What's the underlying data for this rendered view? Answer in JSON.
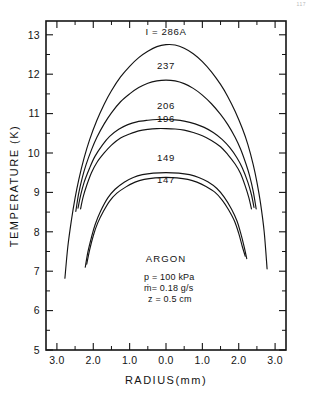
{
  "figure": {
    "corner_mark": "117"
  },
  "chart_data": {
    "type": "line",
    "title": "",
    "xlabel": "RADIUS(mm)",
    "ylabel": "TEMPERATURE (K)",
    "xlim": [
      -3.3,
      3.3
    ],
    "ylim": [
      5,
      13.35
    ],
    "grid": false,
    "legend_position": "inline-curve-labels",
    "x_tick_values": [
      -3.0,
      -2.0,
      -1.0,
      0.0,
      1.0,
      2.0,
      3.0
    ],
    "x_tick_labels": [
      "3.0",
      "2.0",
      "1.0",
      "0.0",
      "1.0",
      "2.0",
      "3.0"
    ],
    "x_minor_step": 0.5,
    "y_tick_values": [
      5,
      6,
      7,
      8,
      9,
      10,
      11,
      12,
      13
    ],
    "y_tick_labels": [
      "5",
      "6",
      "7",
      "8",
      "9",
      "10",
      "11",
      "12",
      "13"
    ],
    "y_minor_step": 0.5,
    "series": [
      {
        "name": "286",
        "label": "I = 286A",
        "current_amperes": 286,
        "peak_temperature_k": 12.75,
        "edge_radius_mm": 2.78,
        "edge_temperature_k": 6.82,
        "label_x_mm": 0.0,
        "label_y_k": 13.0,
        "points": [
          [
            -2.78,
            6.82
          ],
          [
            -2.7,
            7.62
          ],
          [
            -2.6,
            8.3
          ],
          [
            -2.5,
            8.86
          ],
          [
            -2.4,
            9.32
          ],
          [
            -2.25,
            9.88
          ],
          [
            -2.1,
            10.34
          ],
          [
            -1.9,
            10.83
          ],
          [
            -1.7,
            11.24
          ],
          [
            -1.5,
            11.58
          ],
          [
            -1.25,
            11.93
          ],
          [
            -1.0,
            12.2
          ],
          [
            -0.75,
            12.42
          ],
          [
            -0.5,
            12.58
          ],
          [
            -0.25,
            12.7
          ],
          [
            0.0,
            12.75
          ],
          [
            0.25,
            12.74
          ],
          [
            0.5,
            12.66
          ],
          [
            0.75,
            12.52
          ],
          [
            1.0,
            12.32
          ],
          [
            1.25,
            12.06
          ],
          [
            1.5,
            11.74
          ],
          [
            1.7,
            11.43
          ],
          [
            1.9,
            11.06
          ],
          [
            2.1,
            10.62
          ],
          [
            2.25,
            10.22
          ],
          [
            2.4,
            9.7
          ],
          [
            2.5,
            9.26
          ],
          [
            2.6,
            8.72
          ],
          [
            2.7,
            8.0
          ],
          [
            2.78,
            7.06
          ]
        ]
      },
      {
        "name": "237",
        "label": "237",
        "current_amperes": 237,
        "peak_temperature_k": 11.85,
        "edge_radius_mm": 2.48,
        "edge_temperature_k": 8.52,
        "label_x_mm": 0.0,
        "label_y_k": 12.12,
        "points": [
          [
            -2.48,
            8.52
          ],
          [
            -2.4,
            8.98
          ],
          [
            -2.3,
            9.38
          ],
          [
            -2.2,
            9.7
          ],
          [
            -2.05,
            10.08
          ],
          [
            -1.9,
            10.4
          ],
          [
            -1.7,
            10.74
          ],
          [
            -1.5,
            11.02
          ],
          [
            -1.25,
            11.3
          ],
          [
            -1.0,
            11.5
          ],
          [
            -0.75,
            11.66
          ],
          [
            -0.5,
            11.77
          ],
          [
            -0.25,
            11.83
          ],
          [
            0.0,
            11.85
          ],
          [
            0.25,
            11.83
          ],
          [
            0.5,
            11.76
          ],
          [
            0.75,
            11.64
          ],
          [
            1.0,
            11.47
          ],
          [
            1.25,
            11.25
          ],
          [
            1.5,
            10.98
          ],
          [
            1.7,
            10.72
          ],
          [
            1.9,
            10.4
          ],
          [
            2.05,
            10.1
          ],
          [
            2.2,
            9.72
          ],
          [
            2.3,
            9.42
          ],
          [
            2.4,
            9.02
          ],
          [
            2.48,
            8.58
          ]
        ]
      },
      {
        "name": "206",
        "label": "206",
        "current_amperes": 206,
        "peak_temperature_k": 10.85,
        "edge_radius_mm": 2.42,
        "edge_temperature_k": 8.6,
        "label_x_mm": 0.0,
        "label_y_k": 11.12,
        "points": [
          [
            -2.42,
            8.6
          ],
          [
            -2.35,
            8.92
          ],
          [
            -2.25,
            9.26
          ],
          [
            -2.1,
            9.62
          ],
          [
            -1.95,
            9.92
          ],
          [
            -1.75,
            10.2
          ],
          [
            -1.55,
            10.42
          ],
          [
            -1.3,
            10.6
          ],
          [
            -1.05,
            10.72
          ],
          [
            -0.8,
            10.79
          ],
          [
            -0.5,
            10.83
          ],
          [
            -0.25,
            10.85
          ],
          [
            0.0,
            10.85
          ],
          [
            0.25,
            10.84
          ],
          [
            0.5,
            10.81
          ],
          [
            0.8,
            10.74
          ],
          [
            1.05,
            10.65
          ],
          [
            1.3,
            10.52
          ],
          [
            1.55,
            10.34
          ],
          [
            1.75,
            10.14
          ],
          [
            1.95,
            9.88
          ],
          [
            2.1,
            9.62
          ],
          [
            2.25,
            9.26
          ],
          [
            2.35,
            8.94
          ],
          [
            2.42,
            8.62
          ]
        ]
      },
      {
        "name": "196",
        "label": "196",
        "current_amperes": 196,
        "peak_temperature_k": 10.62,
        "edge_radius_mm": 2.35,
        "edge_temperature_k": 8.58,
        "label_x_mm": 0.0,
        "label_y_k": 10.78,
        "points": [
          [
            -2.35,
            8.58
          ],
          [
            -2.28,
            8.88
          ],
          [
            -2.18,
            9.18
          ],
          [
            -2.05,
            9.5
          ],
          [
            -1.9,
            9.76
          ],
          [
            -1.7,
            10.0
          ],
          [
            -1.5,
            10.2
          ],
          [
            -1.25,
            10.38
          ],
          [
            -1.0,
            10.48
          ],
          [
            -0.75,
            10.56
          ],
          [
            -0.5,
            10.6
          ],
          [
            -0.25,
            10.62
          ],
          [
            0.0,
            10.62
          ],
          [
            0.25,
            10.61
          ],
          [
            0.5,
            10.58
          ],
          [
            0.75,
            10.52
          ],
          [
            1.0,
            10.44
          ],
          [
            1.25,
            10.32
          ],
          [
            1.5,
            10.16
          ],
          [
            1.7,
            9.96
          ],
          [
            1.9,
            9.72
          ],
          [
            2.05,
            9.48
          ],
          [
            2.18,
            9.16
          ],
          [
            2.28,
            8.86
          ],
          [
            2.35,
            8.58
          ]
        ]
      },
      {
        "name": "149",
        "label": "149",
        "current_amperes": 149,
        "peak_temperature_k": 9.5,
        "edge_radius_mm": 2.22,
        "edge_temperature_k": 7.1,
        "label_x_mm": 0.0,
        "label_y_k": 9.8,
        "points": [
          [
            -2.22,
            7.1
          ],
          [
            -2.15,
            7.48
          ],
          [
            -2.05,
            7.86
          ],
          [
            -1.95,
            8.18
          ],
          [
            -1.8,
            8.52
          ],
          [
            -1.6,
            8.86
          ],
          [
            -1.4,
            9.08
          ],
          [
            -1.15,
            9.26
          ],
          [
            -0.9,
            9.38
          ],
          [
            -0.65,
            9.45
          ],
          [
            -0.35,
            9.49
          ],
          [
            0.0,
            9.5
          ],
          [
            0.35,
            9.49
          ],
          [
            0.65,
            9.45
          ],
          [
            0.9,
            9.38
          ],
          [
            1.15,
            9.27
          ],
          [
            1.4,
            9.1
          ],
          [
            1.6,
            8.88
          ],
          [
            1.8,
            8.58
          ],
          [
            1.95,
            8.28
          ],
          [
            2.05,
            7.98
          ],
          [
            2.15,
            7.62
          ],
          [
            2.22,
            7.32
          ]
        ]
      },
      {
        "name": "147",
        "label": "147",
        "current_amperes": 147,
        "peak_temperature_k": 9.38,
        "edge_radius_mm": 2.18,
        "edge_temperature_k": 7.18,
        "label_x_mm": 0.0,
        "label_y_k": 9.24,
        "points": [
          [
            -2.18,
            7.18
          ],
          [
            -2.1,
            7.54
          ],
          [
            -2.0,
            7.9
          ],
          [
            -1.88,
            8.22
          ],
          [
            -1.72,
            8.52
          ],
          [
            -1.55,
            8.78
          ],
          [
            -1.35,
            8.98
          ],
          [
            -1.1,
            9.14
          ],
          [
            -0.85,
            9.26
          ],
          [
            -0.6,
            9.33
          ],
          [
            -0.3,
            9.37
          ],
          [
            0.0,
            9.38
          ],
          [
            0.3,
            9.37
          ],
          [
            0.6,
            9.33
          ],
          [
            0.85,
            9.26
          ],
          [
            1.1,
            9.15
          ],
          [
            1.35,
            9.0
          ],
          [
            1.55,
            8.8
          ],
          [
            1.72,
            8.56
          ],
          [
            1.88,
            8.28
          ],
          [
            2.0,
            7.96
          ],
          [
            2.1,
            7.62
          ],
          [
            2.18,
            7.38
          ]
        ]
      }
    ],
    "annotations": {
      "gas": "ARGON",
      "pressure": "p = 100 kPa",
      "mass_flow": "ṁ= 0.18 g/s",
      "axial_position": "z = 0.5 cm"
    }
  }
}
